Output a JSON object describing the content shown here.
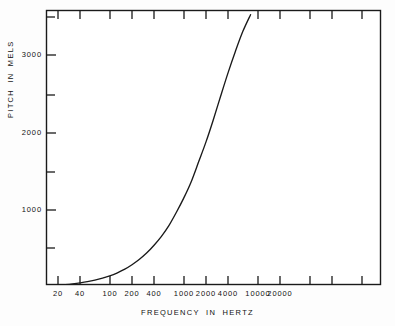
{
  "chart_data": {
    "type": "line",
    "title": "",
    "subtitle": "",
    "xlabel": "FREQUENCY  IN  HERTZ",
    "ylabel": "PITCH  IN  MELS",
    "xscale": "log",
    "yscale": "linear",
    "xlim": [
      18,
      30000
    ],
    "ylim": [
      0,
      3585
    ],
    "grid": false,
    "legend": null,
    "x_major_ticks": [
      20,
      40,
      100,
      200,
      400,
      1000,
      2000,
      4000,
      10000,
      20000
    ],
    "x_tick_labels": [
      "20",
      "40",
      "100",
      "200",
      "400",
      "1000",
      "2000",
      "4000",
      "10000",
      "20000"
    ],
    "x_unlabeled_ticks": [
      28000
    ],
    "y_major_ticks": [
      1000,
      2000,
      3000
    ],
    "y_tick_labels": [
      "1000",
      "2000",
      "3000"
    ],
    "y_minor_ticks": [
      500,
      1500,
      2500,
      3500
    ],
    "series": [
      {
        "name": "mel scale",
        "color": "#1a1a1a",
        "x": [
          20,
          25,
          31.5,
          40,
          50,
          63,
          80,
          100,
          125,
          160,
          200,
          250,
          315,
          400,
          500,
          630,
          800,
          1000,
          1250,
          1600,
          2000,
          2500,
          3150,
          4000,
          5000,
          6300,
          8000,
          10000,
          12500,
          15000
        ],
        "y": [
          29,
          37,
          47,
          60,
          75,
          95,
          121,
          150,
          187,
          237,
          294,
          361,
          444,
          549,
          660,
          798,
          974,
          1153,
          1355,
          1628,
          1879,
          2159,
          2468,
          2779,
          3049,
          3305,
          3520,
          3680,
          3795,
          3860
        ]
      }
    ]
  },
  "axes": {
    "frame": {
      "left": 46,
      "top": 10,
      "right": 381,
      "bottom": 285
    },
    "x_tick_pixels": [
      58,
      80,
      110,
      132,
      154,
      184,
      206,
      228,
      258,
      280
    ],
    "y_tick_pixels_major": [
      210,
      133,
      55
    ],
    "y_tick_pixels_minor": [
      248,
      172,
      95,
      17
    ]
  }
}
